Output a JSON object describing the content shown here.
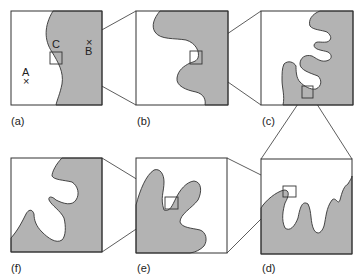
{
  "figure": {
    "panels": [
      {
        "id": "a",
        "label": "(a)"
      },
      {
        "id": "b",
        "label": "(b)"
      },
      {
        "id": "c",
        "label": "(c)"
      },
      {
        "id": "d",
        "label": "(d)"
      },
      {
        "id": "e",
        "label": "(e)"
      },
      {
        "id": "f",
        "label": "(f)"
      }
    ],
    "points": {
      "A": {
        "label": "A",
        "marker": "×"
      },
      "B": {
        "label": "B",
        "marker": "×"
      },
      "C": {
        "label": "C"
      }
    },
    "colors": {
      "land": "#b3b3b3",
      "sea": "#ffffff",
      "stroke": "#333333"
    }
  }
}
